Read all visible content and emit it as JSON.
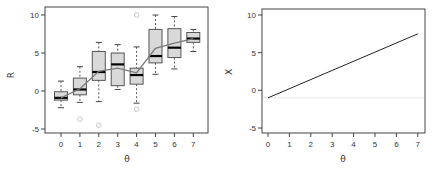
{
  "chart_data": [
    {
      "type": "box",
      "title": "",
      "xlabel": "θ",
      "ylabel": "R",
      "xlim": [
        -0.85,
        7.75
      ],
      "ylim": [
        -5.5,
        10.5
      ],
      "x_ticks": [
        0,
        1,
        2,
        3,
        4,
        5,
        6,
        7
      ],
      "x_tick_labels": [
        "0",
        "1",
        "2",
        "3",
        "4",
        "5",
        "6",
        "7"
      ],
      "y_ticks": [
        -5,
        0,
        5,
        10
      ],
      "y_tick_labels": [
        "-5",
        "0",
        "5",
        "10"
      ],
      "grid": false,
      "legend": null,
      "boxes": [
        {
          "x": 0,
          "whisker_low": -2.2,
          "q1": -1.2,
          "median": -0.9,
          "q3": -0.1,
          "whisker_high": 1.3,
          "outliers": []
        },
        {
          "x": 1,
          "whisker_low": -1.5,
          "q1": -0.5,
          "median": 0.2,
          "q3": 1.7,
          "whisker_high": 3.2,
          "outliers": [
            -3.7
          ]
        },
        {
          "x": 2,
          "whisker_low": -1.4,
          "q1": 1.4,
          "median": 2.5,
          "q3": 5.2,
          "whisker_high": 6.4,
          "outliers": [
            -4.5
          ]
        },
        {
          "x": 3,
          "whisker_low": 0.2,
          "q1": 0.7,
          "median": 3.5,
          "q3": 5.0,
          "whisker_high": 6.1,
          "outliers": []
        },
        {
          "x": 4,
          "whisker_low": -1.6,
          "q1": 0.9,
          "median": 2.1,
          "q3": 3.0,
          "whisker_high": 5.8,
          "outliers": [
            10.0,
            -2.4
          ]
        },
        {
          "x": 5,
          "whisker_low": 2.2,
          "q1": 3.7,
          "median": 4.6,
          "q3": 8.1,
          "whisker_high": 10.0,
          "outliers": []
        },
        {
          "x": 6,
          "whisker_low": 2.9,
          "q1": 4.4,
          "median": 5.7,
          "q3": 8.2,
          "whisker_high": 9.8,
          "outliers": []
        },
        {
          "x": 7,
          "whisker_low": 5.2,
          "q1": 6.4,
          "median": 6.9,
          "q3": 7.7,
          "whisker_high": 8.1,
          "outliers": []
        }
      ],
      "mean_line": {
        "name": "mean",
        "x": [
          0,
          1,
          2,
          3,
          4,
          5,
          6,
          7
        ],
        "values": [
          -0.9,
          0.3,
          2.6,
          3.0,
          2.4,
          5.6,
          6.3,
          6.9
        ]
      },
      "colors": {
        "box_fill": "#d9d9d9",
        "box_border": "#555555",
        "median": "#000000",
        "mean_line": "#7a7a7a",
        "outlier": "#c8c8c8"
      }
    },
    {
      "type": "line",
      "title": "",
      "xlabel": "θ",
      "ylabel": "X",
      "xlim": [
        -0.3,
        7.3
      ],
      "ylim": [
        -5.5,
        10.5
      ],
      "x_ticks": [
        0,
        1,
        2,
        3,
        4,
        5,
        6,
        7
      ],
      "x_tick_labels": [
        "0",
        "1",
        "2",
        "3",
        "4",
        "5",
        "6",
        "7"
      ],
      "y_ticks": [
        -5,
        0,
        5,
        10
      ],
      "y_tick_labels": [
        "-5",
        "0",
        "5",
        "10"
      ],
      "grid": false,
      "legend": null,
      "series": [
        {
          "name": "X",
          "x": [
            0,
            7
          ],
          "values": [
            -1.0,
            7.5
          ],
          "color": "#222222"
        }
      ],
      "hlines": [
        {
          "y": -1.0,
          "color": "#e8e8e8"
        }
      ]
    }
  ]
}
